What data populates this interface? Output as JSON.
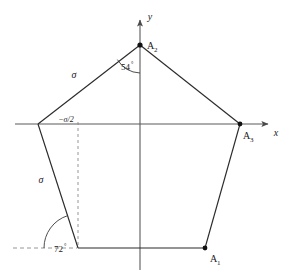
{
  "figure": {
    "background_color": "#ffffff",
    "stroke_color": "#2b2b2b",
    "axis_color": "#555555",
    "dash_color": "#777777"
  },
  "axes": {
    "x_label": "x",
    "y_label": "y",
    "origin": {
      "x": 140,
      "y": 124
    },
    "x_start": {
      "x": 15,
      "y": 124
    },
    "x_end": {
      "x": 272,
      "y": 124
    },
    "y_start": {
      "x": 140,
      "y": 270
    },
    "y_end": {
      "x": 140,
      "y": 16
    }
  },
  "vertices": [
    {
      "name": "A1",
      "label": "A",
      "subscript": "1",
      "x": 205,
      "y": 248,
      "dot": true,
      "label_x": 210,
      "label_y": 262
    },
    {
      "name": "A2",
      "label": "A",
      "subscript": "2",
      "x": 140,
      "y": 45,
      "dot": true,
      "label_x": 147,
      "label_y": 49
    },
    {
      "name": "A3",
      "label": "A",
      "subscript": "3",
      "x": 240,
      "y": 124,
      "dot": true,
      "label_x": 244,
      "label_y": 139
    },
    {
      "name": "A4",
      "label": "",
      "subscript": "",
      "x": 38,
      "y": 124,
      "dot": false,
      "label_x": 0,
      "label_y": 0
    },
    {
      "name": "A5",
      "label": "",
      "subscript": "",
      "x": 78,
      "y": 248,
      "dot": false,
      "label_x": 0,
      "label_y": 0
    }
  ],
  "edges": [
    {
      "name": "edge-A2-A4",
      "from": "A2",
      "to": "A4"
    },
    {
      "name": "edge-A4-A5",
      "from": "A4",
      "to": "A5"
    },
    {
      "name": "edge-A5-A1",
      "from": "A5",
      "to": "A1"
    },
    {
      "name": "edge-A1-A3",
      "from": "A1",
      "to": "A3"
    },
    {
      "name": "edge-A3-A2",
      "from": "A3",
      "to": "A2"
    }
  ],
  "side_labels": [
    {
      "name": "sigma-upper-left",
      "text": "σ",
      "x": 74,
      "y": 78
    },
    {
      "name": "sigma-lower-left",
      "text": "σ",
      "x": 41,
      "y": 183
    }
  ],
  "angle_labels": [
    {
      "name": "angle-54",
      "value": "54",
      "unit": "°",
      "x": 121,
      "y": 70
    },
    {
      "name": "angle-72",
      "value": "72",
      "unit": "°",
      "x": 54,
      "y": 252
    }
  ],
  "coordinate_labels": [
    {
      "name": "neg-sigma-over-2",
      "text": "−σ/2",
      "x": 66,
      "y": 122
    }
  ],
  "dashed_lines": [
    {
      "name": "vertical-guide-sigma-half",
      "x1": 78,
      "y1": 124,
      "x2": 78,
      "y2": 248
    },
    {
      "name": "horizontal-guide-72deg",
      "x1": 14,
      "y1": 248,
      "x2": 78,
      "y2": 248
    }
  ],
  "angle_arcs": [
    {
      "name": "arc-54-at-A2",
      "cx": 140,
      "cy": 45,
      "radius": 28
    },
    {
      "name": "arc-72-at-bottom-left",
      "cx": 78,
      "cy": 248,
      "radius": 34
    }
  ]
}
